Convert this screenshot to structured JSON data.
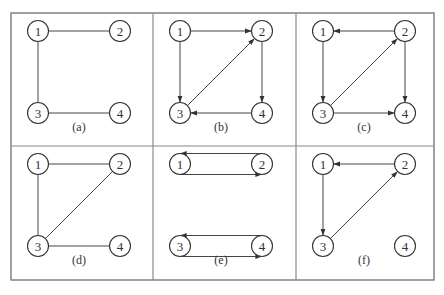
{
  "figure": {
    "colors": {
      "stroke": "#444444",
      "frame": "#7a7a7a",
      "text": "#333333",
      "background": "#ffffff"
    },
    "frame": {
      "x": 11,
      "y": 13,
      "width": 423,
      "height": 267
    },
    "dividers": {
      "vertical": [
        153,
        296
      ],
      "horizontal": [
        146
      ]
    },
    "node_radius": 10.5,
    "node_offsets": {
      "1": [
        27,
        18
      ],
      "2": [
        109,
        18
      ],
      "3": [
        27,
        100
      ],
      "4": [
        109,
        100
      ]
    },
    "label_offset": [
      68,
      114
    ]
  },
  "panels": [
    {
      "id": "a",
      "label": "(a)",
      "origin": [
        11,
        13
      ],
      "nodes": [
        "1",
        "2",
        "3",
        "4"
      ],
      "edges": [
        {
          "from": "1",
          "to": "2",
          "directed": false
        },
        {
          "from": "1",
          "to": "3",
          "directed": false
        },
        {
          "from": "3",
          "to": "4",
          "directed": false
        }
      ]
    },
    {
      "id": "b",
      "label": "(b)",
      "origin": [
        153,
        13
      ],
      "nodes": [
        "1",
        "2",
        "3",
        "4"
      ],
      "edges": [
        {
          "from": "1",
          "to": "2",
          "directed": true
        },
        {
          "from": "1",
          "to": "3",
          "directed": true
        },
        {
          "from": "2",
          "to": "4",
          "directed": true
        },
        {
          "from": "4",
          "to": "3",
          "directed": true
        },
        {
          "from": "3",
          "to": "2",
          "directed": true
        }
      ]
    },
    {
      "id": "c",
      "label": "(c)",
      "origin": [
        296,
        13
      ],
      "nodes": [
        "1",
        "2",
        "3",
        "4"
      ],
      "edges": [
        {
          "from": "2",
          "to": "1",
          "directed": true
        },
        {
          "from": "1",
          "to": "3",
          "directed": true
        },
        {
          "from": "2",
          "to": "4",
          "directed": true
        },
        {
          "from": "3",
          "to": "4",
          "directed": true
        },
        {
          "from": "3",
          "to": "2",
          "directed": true
        }
      ]
    },
    {
      "id": "d",
      "label": "(d)",
      "origin": [
        11,
        146
      ],
      "nodes": [
        "1",
        "2",
        "3",
        "4"
      ],
      "edges": [
        {
          "from": "1",
          "to": "2",
          "directed": false
        },
        {
          "from": "1",
          "to": "3",
          "directed": false
        },
        {
          "from": "3",
          "to": "4",
          "directed": false
        },
        {
          "from": "3",
          "to": "2",
          "directed": false
        }
      ]
    },
    {
      "id": "e",
      "label": "(e)",
      "origin": [
        153,
        146
      ],
      "nodes": [
        "1",
        "2",
        "3",
        "4"
      ],
      "edges": [
        {
          "from": "2",
          "to": "1",
          "directed": true,
          "style": "tangent-top"
        },
        {
          "from": "1",
          "to": "2",
          "directed": true,
          "style": "tangent-bottom"
        },
        {
          "from": "4",
          "to": "3",
          "directed": true,
          "style": "tangent-top"
        },
        {
          "from": "3",
          "to": "4",
          "directed": true,
          "style": "tangent-bottom"
        }
      ]
    },
    {
      "id": "f",
      "label": "(f)",
      "origin": [
        296,
        146
      ],
      "nodes": [
        "1",
        "2",
        "3",
        "4"
      ],
      "edges": [
        {
          "from": "2",
          "to": "1",
          "directed": true
        },
        {
          "from": "1",
          "to": "3",
          "directed": true
        },
        {
          "from": "3",
          "to": "2",
          "directed": true
        }
      ]
    }
  ]
}
